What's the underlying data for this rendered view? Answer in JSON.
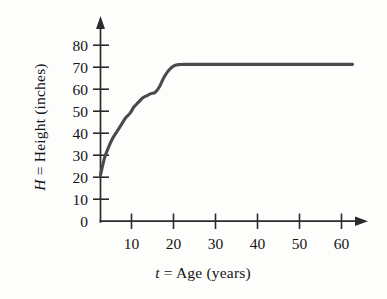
{
  "chart_data": {
    "type": "line",
    "title": "",
    "xlabel": "t = Age (years)",
    "ylabel": "H = Height (inches)",
    "xlabel_parts": {
      "symbol": "t",
      "rest": "= Age (years)"
    },
    "ylabel_parts": {
      "symbol": "H",
      "rest": "= Height (inches)"
    },
    "xlim": [
      0,
      65
    ],
    "ylim": [
      0,
      85
    ],
    "xticks": [
      10,
      20,
      30,
      40,
      50,
      60
    ],
    "yticks": [
      0,
      10,
      20,
      30,
      40,
      50,
      60,
      70,
      80
    ],
    "xtick_labels": [
      "10",
      "20",
      "30",
      "40",
      "50",
      "60"
    ],
    "ytick_labels": [
      "0",
      "10",
      "20",
      "30",
      "40",
      "50",
      "60",
      "70",
      "80"
    ],
    "grid": false,
    "legend": "none",
    "series": [
      {
        "name": "Height vs Age",
        "color": "#4a4a4a",
        "x": [
          0,
          1,
          2,
          3,
          4,
          5,
          6,
          7,
          8,
          9,
          10,
          11,
          12,
          13,
          14,
          15,
          16,
          17,
          18,
          19,
          20,
          25,
          30,
          35,
          40,
          45,
          50,
          55,
          60
        ],
        "y": [
          21,
          29,
          34,
          38,
          41,
          44,
          47,
          49,
          52,
          54,
          56,
          57,
          58,
          58.5,
          61,
          65,
          68,
          70,
          71,
          71.2,
          71.3,
          71.3,
          71.3,
          71.3,
          71.3,
          71.3,
          71.3,
          71.3,
          71.3
        ]
      }
    ],
    "annotations": []
  },
  "axes": {
    "x_axis_name": "age-axis",
    "y_axis_name": "height-axis",
    "x_arrow": true,
    "y_arrow": true
  },
  "colors": {
    "curve": "#4a4a4a",
    "axis": "#2b2b2b",
    "text": "#141414",
    "background": "#fdfdfc"
  }
}
